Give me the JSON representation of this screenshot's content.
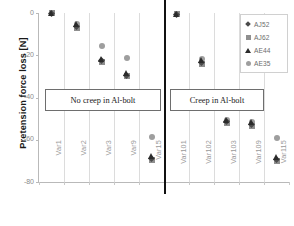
{
  "chart_data": {
    "type": "scatter",
    "title": "",
    "xlabel": "",
    "ylabel": "Pretension force loss [N]",
    "ylim": [
      -80,
      0
    ],
    "yticks": [
      0,
      -20,
      -40,
      -60,
      -80
    ],
    "ytick_labels": [
      "0",
      "-20",
      "-40",
      "-60",
      "-80"
    ],
    "grid": "vertical",
    "legend_position": "top-right",
    "categories": [
      "Var1",
      "Var2",
      "Var3",
      "Var9",
      "Var15",
      "Var101",
      "Var102",
      "Var103",
      "Var109",
      "Var115"
    ],
    "series": [
      {
        "name": "AJ52",
        "marker": "diamond",
        "color": "#4a4a4a",
        "values": [
          0.0,
          -6.5,
          -22.5,
          -29.5,
          -69.0,
          -0.5,
          -23.5,
          -51.5,
          -53.0,
          -69.5
        ]
      },
      {
        "name": "AJ62",
        "marker": "square",
        "color": "#8f8f8f",
        "values": [
          0.0,
          -7.0,
          -23.0,
          -30.0,
          -69.5,
          -0.5,
          -24.0,
          -52.0,
          -53.5,
          -70.0
        ]
      },
      {
        "name": "AE44",
        "marker": "triangle",
        "color": "#2b2b2b",
        "values": [
          0.0,
          -5.5,
          -22.0,
          -28.5,
          -68.0,
          -0.5,
          -22.5,
          -51.0,
          -52.0,
          -68.5
        ]
      },
      {
        "name": "AE35",
        "marker": "circle",
        "color": "#9e9e9e",
        "values": [
          0.0,
          -5.0,
          -15.5,
          -21.5,
          -58.5,
          -0.5,
          -22.0,
          -50.5,
          -51.5,
          -59.0
        ]
      }
    ],
    "annotations": [
      {
        "id": "no-creep",
        "text": "No creep in Al-bolt"
      },
      {
        "id": "creep",
        "text": "Creep in Al-bolt"
      }
    ],
    "divider": {
      "after_category": "Var15",
      "style": "thick-black-vertical-line"
    }
  },
  "legend": {
    "entries": [
      {
        "label": "AJ52",
        "marker": "diamond"
      },
      {
        "label": "AJ62",
        "marker": "square"
      },
      {
        "label": "AE44",
        "marker": "triangle"
      },
      {
        "label": "AE35",
        "marker": "circle"
      }
    ]
  }
}
